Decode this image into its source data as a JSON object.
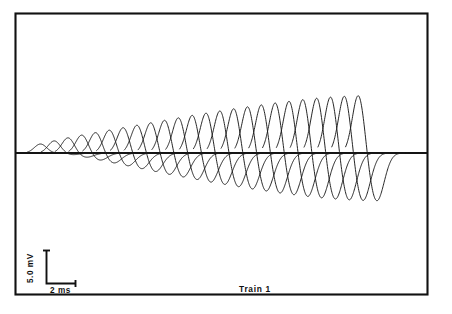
{
  "figure": {
    "caption": "Train 1",
    "background_color": "#ffffff",
    "trace_color": "#1a1a1a",
    "frame_color": "#111111"
  },
  "scale_bar": {
    "vertical_label": "5.0 mV",
    "horizontal_label": "2 ms",
    "vertical_units": "mV",
    "vertical_value": "5.0",
    "horizontal_units": "ms",
    "horizontal_value": "2"
  },
  "chart_data": {
    "type": "line",
    "title": "Train 1",
    "subtitle": "",
    "xlabel": "",
    "ylabel": "",
    "legend": [],
    "grid": false,
    "axis_frame": true,
    "x_units": "ms",
    "y_units": "mV",
    "xlim": [
      0,
      52
    ],
    "ylim": [
      -9.5,
      11.0
    ],
    "baseline_value": 0,
    "pulse_count": 24,
    "pulse_interval_ms": 1.75,
    "pulse_start_ms": 3.1,
    "series": [
      {
        "name": "Compound action potential train",
        "peak_amplitudes_mV": [
          1.55,
          2.1,
          2.65,
          3.15,
          3.6,
          4.05,
          4.5,
          4.95,
          5.4,
          5.85,
          6.3,
          6.75,
          7.15,
          7.55,
          7.95,
          8.3,
          8.65,
          9.0,
          9.3,
          9.6,
          9.85,
          10.05,
          10.2,
          10.3
        ],
        "trough_amplitudes_mV": [
          -0.05,
          -0.3,
          -0.75,
          -1.25,
          -1.75,
          -2.25,
          -2.75,
          -3.25,
          -3.75,
          -4.2,
          -4.65,
          -5.1,
          -5.5,
          -5.9,
          -6.3,
          -6.65,
          -7.0,
          -7.3,
          -7.6,
          -7.85,
          -8.05,
          -8.2,
          -8.3,
          -8.35
        ],
        "peak_times_ms": [
          3.1,
          4.85,
          6.6,
          8.35,
          10.1,
          11.85,
          13.6,
          15.35,
          17.1,
          18.85,
          20.6,
          22.35,
          24.1,
          25.85,
          27.6,
          29.35,
          31.1,
          32.85,
          34.6,
          36.35,
          38.1,
          39.85,
          41.6,
          43.35
        ]
      }
    ]
  }
}
